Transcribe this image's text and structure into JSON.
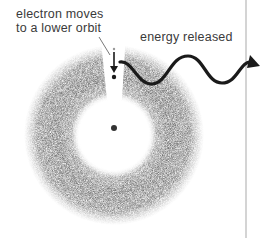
{
  "diagram": {
    "labels": {
      "electron_line1": "electron moves",
      "electron_line2": "to a lower orbit",
      "energy": "energy released"
    },
    "elements": {
      "electron_cloud": "gray ring-shaped electron cloud with gap at top",
      "nucleus": "small dark dot at center",
      "electron": "small dot with downward arrow",
      "photon": "wavy arrow moving right"
    },
    "colors": {
      "cloud": "#6e6e6e",
      "ink": "#1a1a1a",
      "text": "#3a3a3a",
      "divider": "#b8b8b8"
    }
  }
}
